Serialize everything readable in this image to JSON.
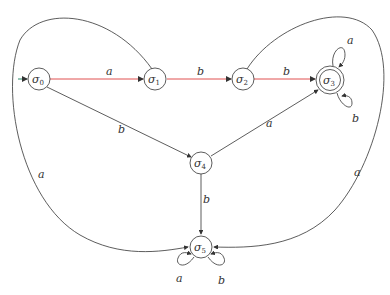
{
  "diagram": {
    "type": "finite-automaton",
    "colors": {
      "edge": "#333333",
      "highlight": "#e05050",
      "initial": "#2a8a6a",
      "background": "#ffffff"
    },
    "states": [
      {
        "id": "s0",
        "base": "σ",
        "sub": "0",
        "initial": true,
        "accepting": false
      },
      {
        "id": "s1",
        "base": "σ",
        "sub": "1",
        "initial": false,
        "accepting": false
      },
      {
        "id": "s2",
        "base": "σ",
        "sub": "2",
        "initial": false,
        "accepting": false
      },
      {
        "id": "s3",
        "base": "σ",
        "sub": "3",
        "initial": false,
        "accepting": true
      },
      {
        "id": "s4",
        "base": "σ",
        "sub": "4",
        "initial": false,
        "accepting": false
      },
      {
        "id": "s5",
        "base": "σ",
        "sub": "5",
        "initial": false,
        "accepting": false
      }
    ],
    "transitions": [
      {
        "from": "s0",
        "to": "s1",
        "label": "a",
        "highlight": true
      },
      {
        "from": "s1",
        "to": "s2",
        "label": "b",
        "highlight": true
      },
      {
        "from": "s2",
        "to": "s3",
        "label": "b",
        "highlight": true
      },
      {
        "from": "s0",
        "to": "s4",
        "label": "b"
      },
      {
        "from": "s4",
        "to": "s3",
        "label": "a"
      },
      {
        "from": "s4",
        "to": "s5",
        "label": "b"
      },
      {
        "from": "s1",
        "to": "s5",
        "label": "a"
      },
      {
        "from": "s2",
        "to": "s5",
        "label": "a"
      },
      {
        "from": "s3",
        "to": "s3",
        "label": "a"
      },
      {
        "from": "s3",
        "to": "s3",
        "label": "b"
      },
      {
        "from": "s5",
        "to": "s5",
        "label": "a"
      },
      {
        "from": "s5",
        "to": "s5",
        "label": "b"
      }
    ]
  }
}
